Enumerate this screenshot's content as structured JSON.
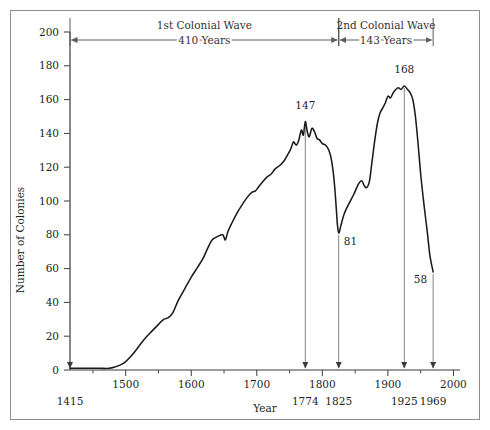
{
  "chart_data": {
    "type": "line",
    "title": "",
    "xlabel": "Year",
    "ylabel": "Number of Colonies",
    "xlim": [
      1415,
      2010
    ],
    "ylim": [
      0,
      200
    ],
    "grid": false,
    "legend": "none",
    "y_ticks": [
      0,
      20,
      40,
      60,
      80,
      100,
      120,
      140,
      160,
      180,
      200
    ],
    "y_tick_labels": [
      "0",
      "20",
      "40",
      "60",
      "80",
      "100",
      "120",
      "140",
      "160",
      "180",
      "200"
    ],
    "x_ticks": [
      1500,
      1600,
      1700,
      1800,
      1900,
      2000
    ],
    "x_tick_labels": [
      "1500",
      "1600",
      "1700",
      "1800",
      "1900",
      "2000"
    ],
    "x_minor_ticks": [
      1450,
      1550,
      1650,
      1750,
      1850,
      1950
    ],
    "series": [
      {
        "name": "Number of Colonies",
        "x": [
          1415,
          1440,
          1460,
          1475,
          1485,
          1492,
          1500,
          1510,
          1520,
          1530,
          1540,
          1550,
          1558,
          1565,
          1572,
          1580,
          1590,
          1600,
          1610,
          1618,
          1625,
          1632,
          1640,
          1648,
          1652,
          1656,
          1662,
          1670,
          1678,
          1685,
          1692,
          1698,
          1702,
          1708,
          1715,
          1722,
          1728,
          1735,
          1742,
          1748,
          1752,
          1756,
          1760,
          1764,
          1768,
          1771,
          1774,
          1777,
          1780,
          1784,
          1788,
          1792,
          1796,
          1800,
          1805,
          1810,
          1814,
          1818,
          1821,
          1823,
          1825,
          1828,
          1833,
          1840,
          1848,
          1855,
          1860,
          1864,
          1868,
          1872,
          1876,
          1880,
          1884,
          1888,
          1892,
          1896,
          1900,
          1904,
          1908,
          1912,
          1916,
          1920,
          1925,
          1930,
          1934,
          1938,
          1942,
          1946,
          1950,
          1955,
          1960,
          1964,
          1969
        ],
        "y": [
          1,
          1,
          1,
          1,
          2,
          3,
          5,
          9,
          14,
          19,
          23,
          27,
          30,
          31,
          34,
          41,
          48,
          55,
          61,
          66,
          72,
          77,
          79,
          80,
          77,
          82,
          87,
          93,
          98,
          102,
          105,
          106,
          108,
          111,
          114,
          116,
          119,
          121,
          124,
          128,
          131,
          135,
          133,
          136,
          142,
          139,
          147,
          141,
          138,
          143,
          141,
          137,
          136,
          134,
          133,
          130,
          124,
          112,
          97,
          86,
          81,
          85,
          92,
          98,
          104,
          110,
          112,
          109,
          108,
          112,
          124,
          136,
          146,
          152,
          155,
          158,
          162,
          161,
          164,
          166,
          167,
          166,
          168,
          166,
          164,
          160,
          150,
          134,
          116,
          98,
          82,
          68,
          58
        ]
      }
    ],
    "annotations": [
      {
        "id": "wave1",
        "label": "1st Colonial Wave",
        "sublabel": "410 Years",
        "from_year": 1415,
        "to_year": 1825
      },
      {
        "id": "wave2",
        "label": "2nd Colonial Wave",
        "sublabel": "143 Years",
        "from_year": 1825,
        "to_year": 1969
      },
      {
        "id": "pt-1774",
        "value": "147",
        "year": 1774,
        "y": 147
      },
      {
        "id": "pt-1825",
        "value": "81",
        "year": 1825,
        "y": 81
      },
      {
        "id": "pt-1925",
        "value": "168",
        "year": 1925,
        "y": 168
      },
      {
        "id": "pt-1969",
        "value": "58",
        "year": 1969,
        "y": 58
      }
    ],
    "marker_years": [
      {
        "year": 1415,
        "label": "1415"
      },
      {
        "year": 1774,
        "label": "1774"
      },
      {
        "year": 1825,
        "label": "1825"
      },
      {
        "year": 1925,
        "label": "1925"
      },
      {
        "year": 1969,
        "label": "1969"
      }
    ],
    "colors": {
      "line": "#1b1b1b",
      "axis": "#3a3a3a",
      "marker": "#7d7d7d",
      "frame": "#8e8e8e",
      "text": "#231f20"
    }
  }
}
